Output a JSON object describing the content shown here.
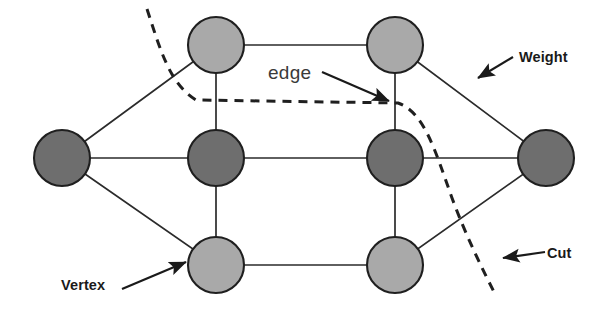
{
  "figure": {
    "background_color": "#ffffff",
    "line_color": "#2b2b2b",
    "annotation_color": "#1a1a1a"
  },
  "annotations": [
    {
      "id": "weight",
      "label": "Weight",
      "style": "bold",
      "points_to": "diagonal-edge-top-right"
    },
    {
      "id": "cut",
      "label": "Cut",
      "style": "bold",
      "points_to": "dashed-cut-curve"
    },
    {
      "id": "vertex",
      "label": "Vertex",
      "style": "bold",
      "points_to": "vertex-bottom-left"
    },
    {
      "id": "edge",
      "label": "edge",
      "style": "plain",
      "points_to": "vertical-edge-right-column"
    }
  ],
  "graph": {
    "vertex_fill_light": "#a9a9a9",
    "vertex_fill_dark": "#6e6e6e",
    "vertex_stroke": "#1f1f1f",
    "vertex_radius": 28,
    "vertices": [
      {
        "id": "v-top-left",
        "x": 216,
        "y": 45,
        "shade": "light"
      },
      {
        "id": "v-top-right",
        "x": 395,
        "y": 45,
        "shade": "light"
      },
      {
        "id": "v-mid-far-left",
        "x": 62,
        "y": 158,
        "shade": "dark"
      },
      {
        "id": "v-mid-left",
        "x": 216,
        "y": 158,
        "shade": "dark"
      },
      {
        "id": "v-mid-right",
        "x": 395,
        "y": 158,
        "shade": "dark"
      },
      {
        "id": "v-mid-far-right",
        "x": 546,
        "y": 158,
        "shade": "dark"
      },
      {
        "id": "v-bottom-left",
        "x": 216,
        "y": 265,
        "shade": "light"
      },
      {
        "id": "v-bottom-right",
        "x": 395,
        "y": 265,
        "shade": "light"
      }
    ],
    "edges": [
      {
        "from": "v-top-left",
        "to": "v-top-right"
      },
      {
        "from": "v-bottom-left",
        "to": "v-bottom-right"
      },
      {
        "from": "v-mid-far-left",
        "to": "v-mid-left"
      },
      {
        "from": "v-mid-left",
        "to": "v-mid-right"
      },
      {
        "from": "v-mid-right",
        "to": "v-mid-far-right"
      },
      {
        "from": "v-top-left",
        "to": "v-mid-left"
      },
      {
        "from": "v-mid-left",
        "to": "v-bottom-left"
      },
      {
        "from": "v-top-right",
        "to": "v-mid-right"
      },
      {
        "from": "v-mid-right",
        "to": "v-bottom-right"
      },
      {
        "from": "v-mid-far-left",
        "to": "v-top-left"
      },
      {
        "from": "v-mid-far-left",
        "to": "v-bottom-left"
      },
      {
        "from": "v-top-right",
        "to": "v-mid-far-right"
      },
      {
        "from": "v-bottom-right",
        "to": "v-mid-far-right"
      }
    ],
    "cut_curve": {
      "id": "dashed-cut-curve",
      "style": "dashed",
      "dash_pattern": "9 7",
      "path": "M 147 9 C 161 52 170 84 196 100 L 398 103 C 424 112 435 150 452 198 C 466 236 482 268 495 294"
    }
  }
}
